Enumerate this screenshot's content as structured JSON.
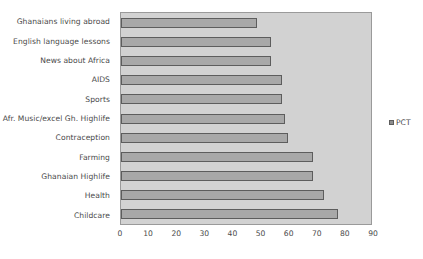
{
  "chart_data": {
    "type": "bar",
    "orientation": "horizontal",
    "title": "",
    "xlabel": "",
    "ylabel": "",
    "xlim": [
      0,
      90
    ],
    "xticks": [
      0,
      10,
      20,
      30,
      40,
      50,
      60,
      70,
      80,
      90
    ],
    "grid": false,
    "legend": {
      "position": "right",
      "entries": [
        "PCT"
      ]
    },
    "series": [
      {
        "name": "PCT",
        "color": "#a8a8a8",
        "values": [
          49,
          54,
          54,
          58,
          58,
          59,
          60,
          69,
          69,
          73,
          78
        ]
      }
    ],
    "categories": [
      "Ghanaians living abroad",
      "English language lessons",
      "News about Africa",
      "AIDS",
      "Sports",
      "Afr. Music/excel Gh. Highlife",
      "Contraception",
      "Farming",
      "Ghanaian Highlife",
      "Health",
      "Childcare"
    ]
  },
  "colors": {
    "bar_fill": "#a8a8a8",
    "bar_edge": "#5d5d5d",
    "plot_background": "#d2d2d2",
    "plot_border": "#9a9a9a",
    "text": "#4a4a4a",
    "page_background": "#ffffff"
  }
}
